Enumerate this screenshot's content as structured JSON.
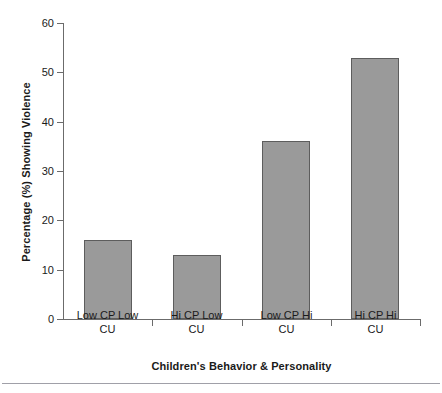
{
  "chart_data": {
    "type": "bar",
    "title": "",
    "xlabel": "Children's Behavior & Personality",
    "ylabel": "Percentage (%) Showing Violence",
    "categories": [
      "Low CP Low CU",
      "Hi CP Low CU",
      "Low CP Hi CU",
      "Hi CP Hi CU"
    ],
    "category_lines": [
      [
        "Low CP Low",
        "CU"
      ],
      [
        "Hi CP Low",
        "CU"
      ],
      [
        "Low CP Hi",
        "CU"
      ],
      [
        "Hi CP Hi",
        "CU"
      ]
    ],
    "values": [
      16,
      13,
      36,
      53
    ],
    "ylim": [
      0,
      60
    ],
    "yticks": [
      0,
      10,
      20,
      30,
      40,
      50,
      60
    ],
    "ytick_labels": [
      "0",
      "10",
      "20",
      "30",
      "40",
      "50",
      "60"
    ],
    "grid": false,
    "legend": false,
    "bar_color": "#9a9a9a",
    "bar_edge_color": "#5d5d5d",
    "axis_color": "#6b6b6b",
    "background_color": "#ffffff"
  }
}
